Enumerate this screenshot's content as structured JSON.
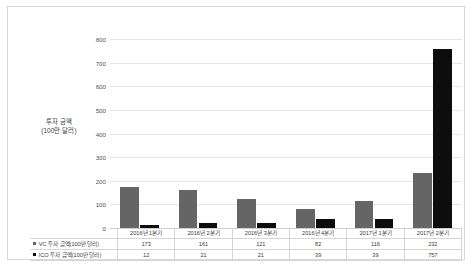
{
  "chart_data": {
    "type": "bar",
    "title": "",
    "xlabel": "",
    "ylabel": "투자 금액\n(100만 달러)",
    "ylabel_line1": "투자 금액",
    "ylabel_line2": "(100만 달러)",
    "ylim": [
      0,
      800
    ],
    "ytick_labels": [
      "800",
      "700",
      "600",
      "500",
      "400",
      "300",
      "200",
      "100",
      "0"
    ],
    "yticks": [
      800,
      700,
      600,
      500,
      400,
      300,
      200,
      100,
      0
    ],
    "grid": true,
    "legend_position": "bottom-table",
    "categories": [
      "2016년 1분기",
      "2016년 2분기",
      "2016년 3분기",
      "2016년 4분기",
      "2017년 1분기",
      "2017년 2분기"
    ],
    "series": [
      {
        "name": "VC 투자 금액(100만 달러)",
        "color": "#656565",
        "values": [
          173,
          161,
          121,
          82,
          116,
          232
        ]
      },
      {
        "name": "ICO 투자 금액(100만 달러)",
        "color": "#0d0d0d",
        "values": [
          12,
          21,
          21,
          39,
          39,
          757
        ]
      }
    ]
  },
  "frame": {
    "border_color": "#d8d8d8",
    "background": "#ffffff"
  }
}
